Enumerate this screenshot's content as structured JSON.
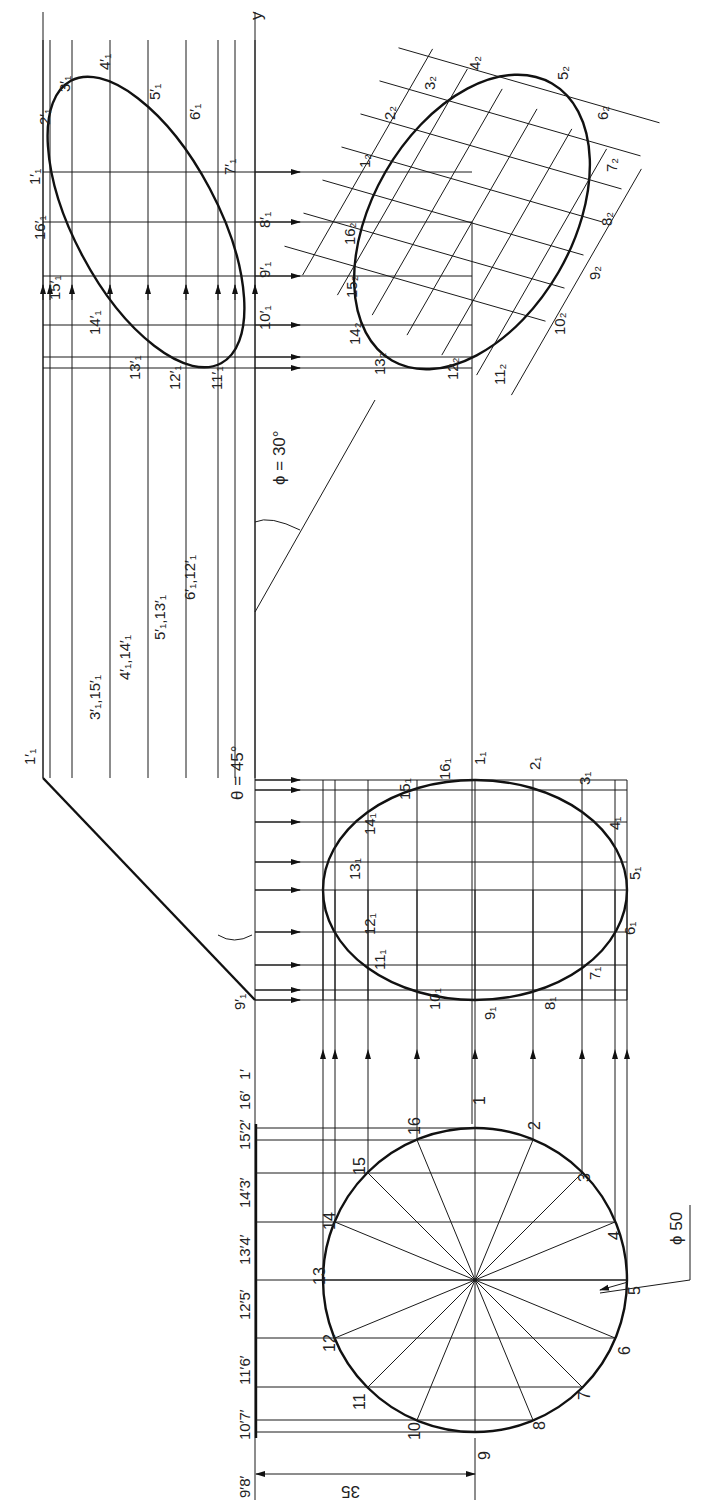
{
  "diagram": {
    "axis_label": "y",
    "angles": {
      "theta": "θ = 45°",
      "phi": "ϕ = 30°"
    },
    "dimensions": {
      "diameter": "ϕ 50",
      "offset": "35"
    },
    "top_view_points": [
      "1",
      "2",
      "3",
      "4",
      "5",
      "6",
      "7",
      "8",
      "9",
      "10",
      "11",
      "12",
      "13",
      "14",
      "15",
      "16"
    ],
    "edge_view_labels": [
      "9′8′",
      "10′7′",
      "11′6′",
      "12′5′",
      "13′4′",
      "14′3′",
      "15′2′",
      "16′",
      "1′"
    ],
    "front_edge_labels": [
      "1′₁",
      "3′₁,15′₁",
      "4′₁,14′₁",
      "5′₁,13′₁",
      "6′₁,12′₁",
      "9′₁"
    ],
    "first_aux_points": [
      "1₁",
      "2₁",
      "3₁",
      "4₁",
      "5₁",
      "6₁",
      "7₁",
      "8₁",
      "9₁",
      "10₁",
      "11₁",
      "12₁",
      "13₁",
      "14₁",
      "15₁",
      "16₁"
    ],
    "second_front_points": [
      "1′₁",
      "2′₁",
      "3′₁",
      "4′₁",
      "5′₁",
      "6′₁",
      "7′₁",
      "8′₁",
      "9′₁",
      "10′₁",
      "11′₁",
      "12′₁",
      "13′₁",
      "14′₁",
      "15′₁",
      "16′₁"
    ],
    "final_points": [
      "1₂",
      "2₂",
      "3₂",
      "4₂",
      "5₂",
      "6₂",
      "7₂",
      "8₂",
      "9₂",
      "10₂",
      "11₂",
      "12₂",
      "13₂",
      "14₂",
      "15₂",
      "16₂"
    ],
    "colors": {
      "line": "#1a1a1a",
      "background": "#ffffff"
    }
  }
}
